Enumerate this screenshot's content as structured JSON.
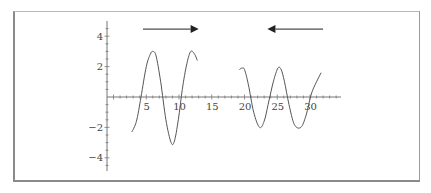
{
  "chart_data": {
    "type": "line",
    "title": "",
    "xlabel": "",
    "ylabel": "",
    "xlim": [
      -1,
      32.5
    ],
    "ylim": [
      -5,
      5
    ],
    "grid": false,
    "legend": null,
    "x_ticks": [
      5,
      10,
      15,
      20,
      25,
      30
    ],
    "x_tick_labels": [
      "5",
      "10",
      "15",
      "20",
      "25",
      "30"
    ],
    "y_ticks": [
      -4,
      -2,
      2,
      4
    ],
    "y_tick_labels": [
      "−4",
      "−2",
      "2",
      "4"
    ],
    "series": [
      {
        "name": "left segment",
        "x": [
          2.8,
          3.5,
          4.2,
          5.0,
          5.6,
          6.0,
          6.5,
          7.2,
          8.0,
          8.8,
          9.3,
          9.9,
          10.5,
          11.2,
          11.8,
          12.4,
          12.8
        ],
        "y": [
          -2.3,
          -1.6,
          0.0,
          2.0,
          2.8,
          3.0,
          2.7,
          1.0,
          -1.5,
          -3.0,
          -2.9,
          -1.5,
          0.5,
          2.2,
          3.0,
          2.8,
          2.4
        ]
      },
      {
        "name": "right segment",
        "x": [
          19.2,
          19.6,
          20.0,
          20.6,
          21.4,
          22.3,
          23.0,
          23.6,
          24.4,
          25.1,
          25.6,
          26.1,
          26.8,
          27.6,
          28.6,
          29.4,
          30.2,
          31.0,
          31.7
        ],
        "y": [
          1.8,
          1.9,
          1.8,
          0.8,
          -1.0,
          -2.0,
          -1.6,
          -0.5,
          1.0,
          1.9,
          1.8,
          1.0,
          -0.5,
          -1.8,
          -2.0,
          -1.2,
          0.2,
          1.0,
          1.6
        ]
      }
    ],
    "annotations": [
      {
        "type": "arrow",
        "direction": "right",
        "from_x": 4.5,
        "to_x": 13.0,
        "y": 4.5
      },
      {
        "type": "arrow",
        "direction": "left",
        "from_x": 32.0,
        "to_x": 23.5,
        "y": 4.5
      }
    ]
  },
  "colors": {
    "curve": "#555555",
    "axis": "#777777",
    "arrow": "#222222",
    "frame": "#8a8a8a"
  }
}
